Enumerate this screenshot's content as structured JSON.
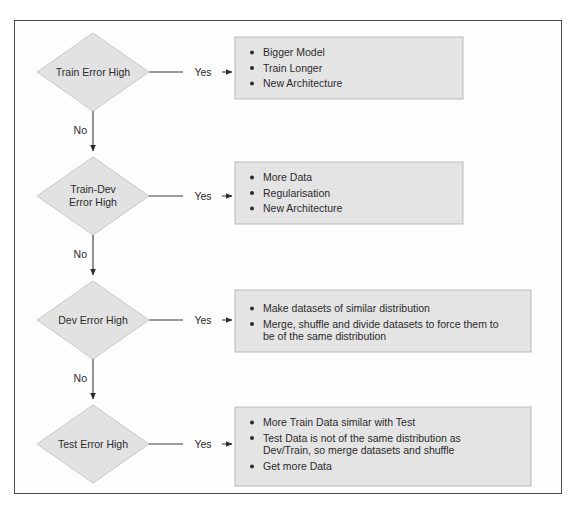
{
  "page": {
    "border_color": "#4a4a4a",
    "background_color": "#ffffff",
    "node_fill": "#e2e2e2",
    "box_fill": "#e4e4e4"
  },
  "labels": {
    "yes": "Yes",
    "no": "No"
  },
  "nodes": [
    {
      "id": "train-error-high",
      "lines": [
        "Train Error High"
      ],
      "yes_label": "Yes",
      "no_label": "No"
    },
    {
      "id": "train-dev-error-high",
      "lines": [
        "Train-Dev",
        "Error High"
      ],
      "yes_label": "Yes",
      "no_label": "No"
    },
    {
      "id": "dev-error-high",
      "lines": [
        "Dev Error High"
      ],
      "yes_label": "Yes",
      "no_label": "No"
    },
    {
      "id": "test-error-high",
      "lines": [
        "Test Error High"
      ],
      "yes_label": "Yes",
      "no_label": ""
    }
  ],
  "actions": [
    {
      "id": "train-error-actions",
      "items": [
        {
          "lines": [
            "Bigger Model"
          ]
        },
        {
          "lines": [
            "Train Longer"
          ]
        },
        {
          "lines": [
            "New Architecture"
          ]
        }
      ]
    },
    {
      "id": "train-dev-error-actions",
      "items": [
        {
          "lines": [
            "More Data"
          ]
        },
        {
          "lines": [
            "Regularisation"
          ]
        },
        {
          "lines": [
            "New Architecture"
          ]
        }
      ]
    },
    {
      "id": "dev-error-actions",
      "items": [
        {
          "lines": [
            "Make datasets of similar distribution"
          ]
        },
        {
          "lines": [
            "Merge, shuffle and divide datasets to force them to",
            "be of the same distribution"
          ]
        }
      ]
    },
    {
      "id": "test-error-actions",
      "items": [
        {
          "lines": [
            "More Train Data similar with Test"
          ]
        },
        {
          "lines": [
            "Test Data is not of the same distribution as",
            "Dev/Train, so merge datasets and shuffle"
          ]
        },
        {
          "lines": [
            "Get more Data"
          ]
        }
      ]
    }
  ]
}
